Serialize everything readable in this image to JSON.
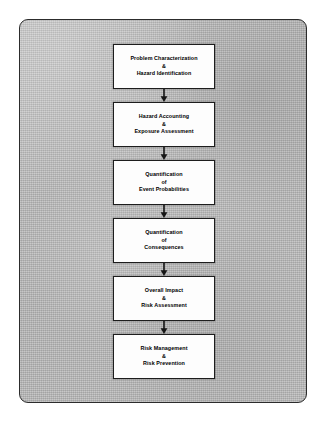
{
  "diagram": {
    "type": "flowchart",
    "orientation": "vertical",
    "connector_icon": "arrow-down-icon",
    "colors": {
      "page_background": "#b4b4b4",
      "frame_border": "#2c2c2c",
      "box_fill": "#fdfdfd",
      "box_border": "#1d1d1d",
      "text": "#000000",
      "arrow": "#151515"
    },
    "steps": [
      {
        "id": "step-1",
        "line1": "Problem Characterization",
        "conjunction": "&",
        "line2": "Hazard Identification"
      },
      {
        "id": "step-2",
        "line1": "Hazard Accounting",
        "conjunction": "&",
        "line2": "Exposure Assessment"
      },
      {
        "id": "step-3",
        "line1": "Quantification",
        "conjunction": "of",
        "line2": "Event Probabilities"
      },
      {
        "id": "step-4",
        "line1": "Quantification",
        "conjunction": "of",
        "line2": "Consequences"
      },
      {
        "id": "step-5",
        "line1": "Overall Impact",
        "conjunction": "&",
        "line2": "Risk Assessment"
      },
      {
        "id": "step-6",
        "line1": "Risk Management",
        "conjunction": "&",
        "line2": "Risk Prevention"
      }
    ]
  }
}
